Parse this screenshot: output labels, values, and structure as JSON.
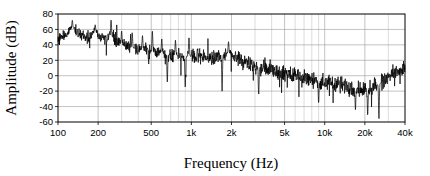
{
  "chart_data": {
    "type": "line",
    "title": "",
    "xlabel": "Frequency (Hz)",
    "ylabel": "Amplitude (dB)",
    "xscale": "log",
    "xlim": [
      100,
      40000
    ],
    "ylim": [
      -60,
      80
    ],
    "grid": true,
    "legend": null,
    "xticks": [
      100,
      200,
      500,
      1000,
      2000,
      5000,
      10000,
      20000,
      40000
    ],
    "xticklabels": [
      "100",
      "200",
      "500",
      "1k",
      "2k",
      "5k",
      "10k",
      "20k",
      "40k"
    ],
    "yticks": [
      -60,
      -40,
      -20,
      0,
      20,
      40,
      60,
      80
    ],
    "yticklabels": [
      "-60",
      "-40",
      "-20",
      "0",
      "20",
      "40",
      "60",
      "80"
    ],
    "minor_xgrid": [
      300,
      400,
      600,
      700,
      800,
      900,
      3000,
      4000,
      6000,
      7000,
      8000,
      9000,
      30000
    ],
    "series": [
      {
        "name": "spectrum",
        "color": "#000000",
        "linewidth": 0.7,
        "description": "Broadband acoustic noise spectrum, log frequency axis, declining trend with resonant peaks at low frequency, a bump near 2 kHz, a minimum near 20 kHz and a rising tail toward 40 kHz",
        "envelope": [
          {
            "f": 100,
            "mean": 46,
            "spread": 9
          },
          {
            "f": 120,
            "mean": 58,
            "spread": 11
          },
          {
            "f": 130,
            "mean": 62,
            "spread": 11
          },
          {
            "f": 150,
            "mean": 52,
            "spread": 10
          },
          {
            "f": 170,
            "mean": 48,
            "spread": 9
          },
          {
            "f": 190,
            "mean": 58,
            "spread": 8
          },
          {
            "f": 210,
            "mean": 48,
            "spread": 9
          },
          {
            "f": 250,
            "mean": 52,
            "spread": 11
          },
          {
            "f": 300,
            "mean": 40,
            "spread": 11
          },
          {
            "f": 400,
            "mean": 34,
            "spread": 12
          },
          {
            "f": 500,
            "mean": 31,
            "spread": 13
          },
          {
            "f": 700,
            "mean": 27,
            "spread": 13
          },
          {
            "f": 1000,
            "mean": 25,
            "spread": 13
          },
          {
            "f": 1400,
            "mean": 24,
            "spread": 14
          },
          {
            "f": 1900,
            "mean": 29,
            "spread": 11
          },
          {
            "f": 2400,
            "mean": 20,
            "spread": 14
          },
          {
            "f": 3000,
            "mean": 13,
            "spread": 14
          },
          {
            "f": 4000,
            "mean": 7,
            "spread": 14
          },
          {
            "f": 5000,
            "mean": 3,
            "spread": 14
          },
          {
            "f": 7000,
            "mean": -3,
            "spread": 14
          },
          {
            "f": 10000,
            "mean": -8,
            "spread": 14
          },
          {
            "f": 14000,
            "mean": -13,
            "spread": 15
          },
          {
            "f": 18000,
            "mean": -17,
            "spread": 16
          },
          {
            "f": 22000,
            "mean": -16,
            "spread": 17
          },
          {
            "f": 26000,
            "mean": -10,
            "spread": 16
          },
          {
            "f": 30000,
            "mean": -3,
            "spread": 15
          },
          {
            "f": 35000,
            "mean": 4,
            "spread": 14
          },
          {
            "f": 40000,
            "mean": 9,
            "spread": 12
          }
        ],
        "peaks": [
          {
            "f": 128,
            "amp": 72
          },
          {
            "f": 190,
            "amp": 66
          },
          {
            "f": 250,
            "amp": 72
          },
          {
            "f": 300,
            "amp": 58
          },
          {
            "f": 360,
            "amp": 56
          },
          {
            "f": 430,
            "amp": 52
          },
          {
            "f": 510,
            "amp": 58
          },
          {
            "f": 600,
            "amp": 48
          },
          {
            "f": 760,
            "amp": 46
          },
          {
            "f": 960,
            "amp": 50
          },
          {
            "f": 1900,
            "amp": 44
          },
          {
            "f": 25500,
            "amp": 16
          }
        ],
        "dips": [
          {
            "f": 660,
            "amp": -8
          },
          {
            "f": 900,
            "amp": -16
          },
          {
            "f": 1700,
            "amp": -20
          },
          {
            "f": 3200,
            "amp": -24
          },
          {
            "f": 9000,
            "amp": -36
          },
          {
            "f": 17000,
            "amp": -44
          },
          {
            "f": 21000,
            "amp": -52
          },
          {
            "f": 25500,
            "amp": -56
          }
        ]
      }
    ]
  },
  "axes": {
    "xlabel": "Frequency (Hz)",
    "ylabel": "Amplitude (dB)"
  }
}
